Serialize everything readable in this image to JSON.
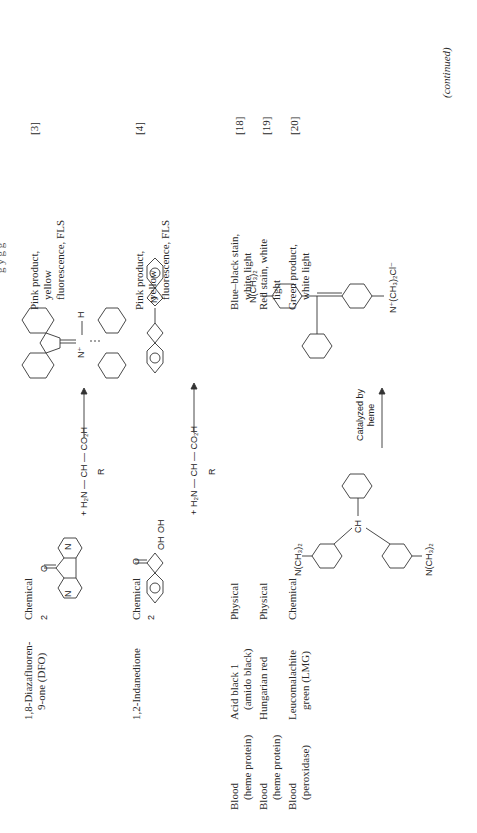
{
  "page": {
    "running_header_fragment": "g      y       g g",
    "continued_label": "(continued)"
  },
  "table": {
    "rows": [
      {
        "target": [],
        "reagent": [
          "1,8-Diazafluoren-",
          "9-one (DFO)"
        ],
        "type": "Chemical",
        "reaction": {
          "stoich": "2",
          "plus": "+",
          "amino_acid": "H₂N — CH — CO₂H",
          "side_chain": "R",
          "product_labels": [
            "N",
            "N",
            "N",
            "N",
            "N⁺",
            "H"
          ],
          "reactant_labels": [
            "N",
            "N",
            "O"
          ]
        },
        "result": [
          "Pink product,",
          "yellow",
          "fluorescence, FLS"
        ],
        "reference": "[3]"
      },
      {
        "target": [],
        "reagent": [
          "1,2-Indanedione"
        ],
        "type": "Chemical",
        "reaction": {
          "stoich": "2",
          "plus": "+",
          "amino_acid": "H₂N — CH — CO₂H",
          "side_chain": "R",
          "reactant_labels": [
            "O",
            "OH",
            "OH"
          ],
          "product_labels": [
            "O",
            "O",
            "N"
          ]
        },
        "result": [
          "Pink product,",
          "yellow",
          "fluorescence, FLS"
        ],
        "reference": "[4]"
      },
      {
        "target": [
          "Blood",
          "(heme protein)"
        ],
        "reagent": [
          "Acid black 1",
          "(amido black)"
        ],
        "type": "Physical",
        "result": [
          "Blue–black stain,",
          "white light"
        ],
        "reference": "[18]"
      },
      {
        "target": [
          "Blood",
          "(heme protein)"
        ],
        "reagent": [
          "Hungarian red"
        ],
        "type": "Physical",
        "result": [
          "Red stain, white",
          "light"
        ],
        "reference": "[19]"
      },
      {
        "target": [
          "Blood",
          "(peroxidase)"
        ],
        "reagent": [
          "Leucomalachite",
          "green (LMG)"
        ],
        "type": "Chemical",
        "reaction": {
          "reactant_labels": [
            "N(CH₃)₂",
            "CH",
            "N(CH₃)₂"
          ],
          "arrow_label": [
            "Catalyzed by",
            "heme"
          ],
          "product_labels": [
            "N(CH₃)₂",
            "C",
            "N⁺(CH₃)₂Cl⁻"
          ]
        },
        "result": [
          "Green product,",
          "white light"
        ],
        "reference": "[20]"
      }
    ]
  }
}
